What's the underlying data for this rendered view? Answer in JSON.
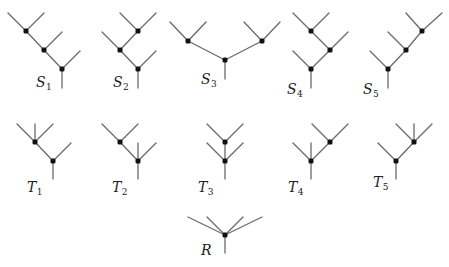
{
  "figure": {
    "colors": {
      "edge": "#6a6a6a",
      "node": "#111111",
      "background": "#ffffff"
    },
    "trees": [
      {
        "id": "S1",
        "label": "S",
        "sub": "1",
        "label_pos": [
          36,
          87
        ],
        "nodes": [
          [
            26,
            31
          ],
          [
            44,
            50
          ],
          [
            62,
            69
          ]
        ],
        "edges": [
          [
            26,
            31,
            8,
            13
          ],
          [
            26,
            31,
            44,
            13
          ],
          [
            26,
            31,
            44,
            50
          ],
          [
            44,
            50,
            62,
            32
          ],
          [
            44,
            50,
            62,
            69
          ],
          [
            62,
            69,
            80,
            51
          ],
          [
            62,
            69,
            62,
            88
          ]
        ]
      },
      {
        "id": "S2",
        "label": "S",
        "sub": "2",
        "label_pos": [
          113,
          87
        ],
        "nodes": [
          [
            138,
            31
          ],
          [
            120,
            50
          ],
          [
            138,
            69
          ]
        ],
        "edges": [
          [
            138,
            31,
            120,
            13
          ],
          [
            138,
            31,
            156,
            13
          ],
          [
            138,
            31,
            120,
            50
          ],
          [
            120,
            50,
            102,
            32
          ],
          [
            120,
            50,
            138,
            69
          ],
          [
            138,
            69,
            156,
            51
          ],
          [
            138,
            69,
            138,
            88
          ]
        ]
      },
      {
        "id": "S3",
        "label": "S",
        "sub": "3",
        "label_pos": [
          201,
          84
        ],
        "nodes": [
          [
            188,
            41
          ],
          [
            262,
            41
          ],
          [
            225,
            60
          ]
        ],
        "edges": [
          [
            188,
            41,
            170,
            22
          ],
          [
            188,
            41,
            206,
            22
          ],
          [
            262,
            41,
            244,
            22
          ],
          [
            262,
            41,
            280,
            22
          ],
          [
            188,
            41,
            225,
            60
          ],
          [
            262,
            41,
            225,
            60
          ],
          [
            225,
            60,
            225,
            79
          ]
        ]
      },
      {
        "id": "S4",
        "label": "S",
        "sub": "4",
        "label_pos": [
          287,
          94
        ],
        "nodes": [
          [
            311,
            31
          ],
          [
            330,
            50
          ],
          [
            311,
            69
          ]
        ],
        "edges": [
          [
            311,
            31,
            293,
            13
          ],
          [
            311,
            31,
            329,
            13
          ],
          [
            311,
            31,
            330,
            50
          ],
          [
            330,
            50,
            348,
            32
          ],
          [
            330,
            50,
            311,
            69
          ],
          [
            311,
            69,
            293,
            51
          ],
          [
            311,
            69,
            311,
            88
          ]
        ]
      },
      {
        "id": "S5",
        "label": "S",
        "sub": "5",
        "label_pos": [
          363,
          94
        ],
        "nodes": [
          [
            422,
            31
          ],
          [
            406,
            50
          ],
          [
            388,
            69
          ]
        ],
        "edges": [
          [
            422,
            31,
            406,
            13
          ],
          [
            422,
            31,
            442,
            13
          ],
          [
            422,
            31,
            406,
            50
          ],
          [
            406,
            50,
            388,
            32
          ],
          [
            406,
            50,
            388,
            69
          ],
          [
            388,
            69,
            370,
            51
          ],
          [
            388,
            69,
            388,
            88
          ]
        ]
      },
      {
        "id": "T1",
        "label": "T",
        "sub": "1",
        "label_pos": [
          27,
          192
        ],
        "nodes": [
          [
            35,
            142
          ],
          [
            53,
            161
          ]
        ],
        "edges": [
          [
            35,
            142,
            17,
            124
          ],
          [
            35,
            142,
            35,
            124
          ],
          [
            35,
            142,
            53,
            124
          ],
          [
            35,
            142,
            53,
            161
          ],
          [
            53,
            161,
            71,
            143
          ],
          [
            53,
            161,
            53,
            179
          ]
        ]
      },
      {
        "id": "T2",
        "label": "T",
        "sub": "2",
        "label_pos": [
          112,
          192
        ],
        "nodes": [
          [
            120,
            142
          ],
          [
            138,
            161
          ]
        ],
        "edges": [
          [
            120,
            142,
            102,
            124
          ],
          [
            120,
            142,
            138,
            124
          ],
          [
            120,
            142,
            138,
            161
          ],
          [
            138,
            161,
            138,
            143
          ],
          [
            138,
            161,
            156,
            143
          ],
          [
            138,
            161,
            138,
            179
          ]
        ]
      },
      {
        "id": "T3",
        "label": "T",
        "sub": "3",
        "label_pos": [
          198,
          192
        ],
        "nodes": [
          [
            225,
            142
          ],
          [
            225,
            161
          ]
        ],
        "edges": [
          [
            225,
            142,
            207,
            124
          ],
          [
            225,
            142,
            243,
            124
          ],
          [
            225,
            142,
            225,
            161
          ],
          [
            225,
            161,
            207,
            143
          ],
          [
            225,
            161,
            243,
            143
          ],
          [
            225,
            161,
            225,
            179
          ]
        ]
      },
      {
        "id": "T4",
        "label": "T",
        "sub": "4",
        "label_pos": [
          288,
          192
        ],
        "nodes": [
          [
            330,
            142
          ],
          [
            311,
            161
          ]
        ],
        "edges": [
          [
            330,
            142,
            312,
            124
          ],
          [
            330,
            142,
            348,
            124
          ],
          [
            330,
            142,
            311,
            161
          ],
          [
            311,
            161,
            293,
            143
          ],
          [
            311,
            161,
            311,
            143
          ],
          [
            311,
            161,
            311,
            179
          ]
        ]
      },
      {
        "id": "T5",
        "label": "T",
        "sub": "5",
        "label_pos": [
          373,
          187
        ],
        "nodes": [
          [
            414,
            142
          ],
          [
            396,
            161
          ]
        ],
        "edges": [
          [
            414,
            142,
            396,
            124
          ],
          [
            414,
            142,
            414,
            124
          ],
          [
            414,
            142,
            432,
            124
          ],
          [
            414,
            142,
            396,
            161
          ],
          [
            396,
            161,
            378,
            143
          ],
          [
            396,
            161,
            396,
            179
          ]
        ]
      },
      {
        "id": "R",
        "label": "R",
        "sub": "",
        "label_pos": [
          201,
          255
        ],
        "nodes": [
          [
            225,
            235
          ]
        ],
        "edges": [
          [
            225,
            235,
            188,
            217
          ],
          [
            225,
            235,
            207,
            217
          ],
          [
            225,
            235,
            243,
            217
          ],
          [
            225,
            235,
            262,
            217
          ],
          [
            225,
            235,
            225,
            253
          ]
        ]
      }
    ]
  }
}
